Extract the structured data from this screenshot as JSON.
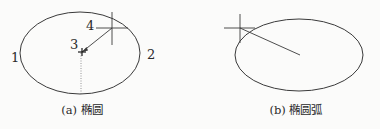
{
  "figure_a": {
    "caption": "(a) 椭圆",
    "point_labels": [
      "1",
      "2",
      "3",
      "4"
    ],
    "ellipse": {
      "cx": 80,
      "cy": 53,
      "rx": 60,
      "ry": 41
    },
    "crosshair": {
      "x": 112,
      "y": 28
    },
    "center_marker": {
      "x": 82,
      "y": 52
    }
  },
  "figure_b": {
    "caption": "(b) 椭圆弧",
    "ellipse": {
      "cx": 299,
      "cy": 55,
      "rx": 64,
      "ry": 36
    },
    "crosshair": {
      "x": 240,
      "y": 28
    },
    "line_end": {
      "x": 300,
      "y": 55
    }
  },
  "colors": {
    "stroke": "#3a3a3a",
    "text": "#2a2a2a",
    "background": "#fbfbfa"
  }
}
